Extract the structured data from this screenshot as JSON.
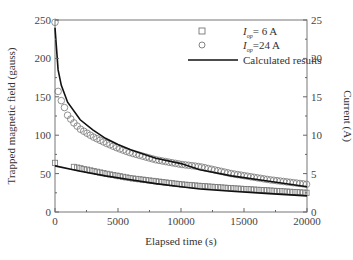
{
  "chart_data": {
    "type": "line",
    "title": "",
    "xlabel": "Elapsed time (s)",
    "ylabel": "Trapped magnetic field (gauss)",
    "ylabel_right": "Current (A)",
    "xlim": [
      0,
      20000
    ],
    "ylim": [
      0,
      250
    ],
    "ylim_right": [
      0,
      25
    ],
    "x_ticks": [
      "0",
      "5000",
      "10000",
      "15000",
      "20000"
    ],
    "y_ticks": [
      "0",
      "50",
      "100",
      "150",
      "200",
      "250"
    ],
    "y_ticks_right": [
      "0",
      "5",
      "10",
      "15",
      "20",
      "25"
    ],
    "grid": false,
    "legend_position": "upper right",
    "legend": [
      {
        "marker": "square",
        "label_prefix": "I",
        "label_sub": "op",
        "label_suffix": "= 6 A"
      },
      {
        "marker": "circle",
        "label_prefix": "I",
        "label_sub": "op",
        "label_suffix": "=24 A"
      },
      {
        "marker": "line",
        "label": "Calculated results"
      }
    ],
    "series": [
      {
        "name": "I_op = 24 A (measured)",
        "marker": "circle",
        "x": [
          0,
          250,
          500,
          750,
          1000,
          1500,
          2000,
          3000,
          4000,
          5000,
          6000,
          8000,
          10000,
          11500,
          14000,
          17000,
          20000
        ],
        "y": [
          247,
          157,
          145,
          136,
          126,
          116,
          108,
          98,
          90,
          83,
          77,
          68,
          62,
          59,
          50,
          42,
          36
        ]
      },
      {
        "name": "I_op = 24 A (calculated)",
        "marker": "line",
        "x": [
          0,
          250,
          500,
          1000,
          2000,
          3000,
          4000,
          5000,
          6000,
          8000,
          10000,
          11500,
          14000,
          17000,
          20000
        ],
        "y": [
          240,
          185,
          165,
          143,
          120,
          107,
          96,
          88,
          81,
          70,
          63,
          55,
          47,
          40,
          33
        ]
      },
      {
        "name": "I_op = 6 A (measured)",
        "marker": "square",
        "x": [
          0,
          2000,
          4000,
          6000,
          8000,
          10000,
          11500,
          14000,
          17000,
          20000
        ],
        "y": [
          64,
          57,
          50,
          44,
          40,
          36,
          34,
          31,
          28,
          25
        ]
      },
      {
        "name": "I_op = 6 A (calculated)",
        "marker": "line",
        "x": [
          0,
          2000,
          4000,
          6000,
          8000,
          10000,
          11500,
          14000,
          17000,
          20000
        ],
        "y": [
          60,
          53,
          47,
          42,
          37,
          33,
          30,
          27,
          24,
          21
        ]
      }
    ]
  }
}
